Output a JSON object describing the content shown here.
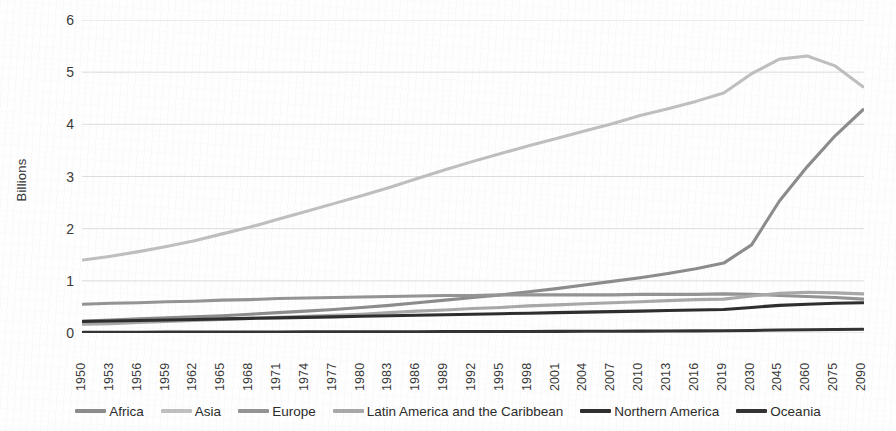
{
  "chart_data": {
    "type": "line",
    "title": "",
    "xlabel": "",
    "ylabel": "Billions",
    "ylim": [
      0,
      6
    ],
    "y_ticks": [
      0,
      1,
      2,
      3,
      4,
      5,
      6
    ],
    "grid": true,
    "legend_position": "bottom",
    "x": [
      1950,
      1953,
      1956,
      1959,
      1962,
      1965,
      1968,
      1971,
      1974,
      1977,
      1980,
      1983,
      1986,
      1989,
      1992,
      1995,
      1998,
      2001,
      2004,
      2007,
      2010,
      2013,
      2016,
      2019,
      2030,
      2045,
      2060,
      2075,
      2090
    ],
    "categories": [
      "1950",
      "1953",
      "1956",
      "1959",
      "1962",
      "1965",
      "1968",
      "1971",
      "1974",
      "1977",
      "1980",
      "1983",
      "1986",
      "1989",
      "1992",
      "1995",
      "1998",
      "2001",
      "2004",
      "2007",
      "2010",
      "2013",
      "2016",
      "2019",
      "2030",
      "2045",
      "2060",
      "2075",
      "2090"
    ],
    "series": [
      {
        "name": "Africa",
        "color": "#8c8c8c",
        "values": [
          0.23,
          0.25,
          0.27,
          0.29,
          0.31,
          0.33,
          0.36,
          0.39,
          0.42,
          0.45,
          0.49,
          0.53,
          0.58,
          0.63,
          0.68,
          0.73,
          0.79,
          0.85,
          0.92,
          0.99,
          1.06,
          1.14,
          1.23,
          1.34,
          1.69,
          2.53,
          3.19,
          3.78,
          4.28
        ]
      },
      {
        "name": "Asia",
        "color": "#bfbfbf",
        "values": [
          1.4,
          1.47,
          1.56,
          1.66,
          1.77,
          1.9,
          2.03,
          2.18,
          2.33,
          2.48,
          2.63,
          2.79,
          2.96,
          3.13,
          3.29,
          3.44,
          3.59,
          3.73,
          3.87,
          4.01,
          4.17,
          4.3,
          4.44,
          4.6,
          4.97,
          5.25,
          5.31,
          5.12,
          4.72
        ]
      },
      {
        "name": "Europe",
        "color": "#949494",
        "values": [
          0.55,
          0.57,
          0.58,
          0.6,
          0.61,
          0.63,
          0.64,
          0.66,
          0.67,
          0.68,
          0.69,
          0.7,
          0.71,
          0.72,
          0.72,
          0.73,
          0.73,
          0.73,
          0.73,
          0.73,
          0.74,
          0.74,
          0.74,
          0.75,
          0.74,
          0.72,
          0.7,
          0.68,
          0.65
        ]
      },
      {
        "name": "Latin America and the Caribbean",
        "color": "#a8a8a8",
        "values": [
          0.17,
          0.18,
          0.2,
          0.22,
          0.24,
          0.26,
          0.28,
          0.3,
          0.32,
          0.34,
          0.36,
          0.39,
          0.42,
          0.44,
          0.47,
          0.49,
          0.52,
          0.54,
          0.56,
          0.58,
          0.6,
          0.62,
          0.64,
          0.65,
          0.71,
          0.76,
          0.78,
          0.77,
          0.75
        ]
      },
      {
        "name": "Northern America",
        "color": "#2e2e2e",
        "values": [
          0.22,
          0.23,
          0.24,
          0.25,
          0.26,
          0.27,
          0.28,
          0.29,
          0.3,
          0.31,
          0.32,
          0.33,
          0.34,
          0.35,
          0.36,
          0.37,
          0.38,
          0.39,
          0.4,
          0.41,
          0.42,
          0.43,
          0.44,
          0.45,
          0.49,
          0.53,
          0.55,
          0.57,
          0.58
        ]
      },
      {
        "name": "Oceania",
        "color": "#333333",
        "values": [
          0.013,
          0.014,
          0.015,
          0.016,
          0.017,
          0.018,
          0.019,
          0.02,
          0.021,
          0.022,
          0.023,
          0.024,
          0.025,
          0.026,
          0.027,
          0.029,
          0.03,
          0.031,
          0.033,
          0.034,
          0.036,
          0.038,
          0.04,
          0.042,
          0.048,
          0.057,
          0.063,
          0.068,
          0.072
        ]
      }
    ]
  },
  "legend": {
    "items": [
      {
        "label": "Africa"
      },
      {
        "label": "Asia"
      },
      {
        "label": "Europe"
      },
      {
        "label": "Latin America and the Caribbean"
      },
      {
        "label": "Northern America"
      },
      {
        "label": "Oceania"
      }
    ]
  },
  "colors": {
    "gridline": "#d9d9d9",
    "background": "#fefefe",
    "tick_text": "#3a3a3a"
  }
}
